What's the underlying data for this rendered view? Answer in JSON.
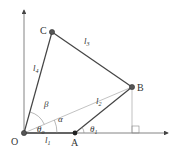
{
  "diagram": {
    "type": "four-bar linkage",
    "points": {
      "O": {
        "label": "O",
        "x": 24,
        "y": 133
      },
      "A": {
        "label": "A",
        "x": 75,
        "y": 133
      },
      "B": {
        "label": "B",
        "x": 132,
        "y": 87
      },
      "C": {
        "label": "C",
        "x": 52,
        "y": 32
      }
    },
    "links": {
      "l1": {
        "label": "l",
        "sub": "1"
      },
      "l2": {
        "label": "l",
        "sub": "2"
      },
      "l3": {
        "label": "l",
        "sub": "3"
      },
      "l4": {
        "label": "l",
        "sub": "4"
      }
    },
    "angles": {
      "theta_o": {
        "label": "θ",
        "sub": "o"
      },
      "theta_1": {
        "label": "θ",
        "sub": "1"
      },
      "alpha": {
        "label": "α"
      },
      "beta": {
        "label": "β"
      }
    },
    "colors": {
      "line": "#444444",
      "thin": "#888888",
      "background": "#ffffff"
    }
  }
}
